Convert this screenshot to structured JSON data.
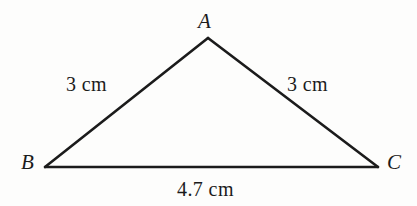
{
  "figure": {
    "type": "triangle-diagram",
    "background_color": "#fdfdfc",
    "stroke_color": "#1b1b1b",
    "text_color": "#1b1b1b"
  },
  "vertices": {
    "a": {
      "label": "A",
      "x": 208,
      "y": 38
    },
    "b": {
      "label": "B",
      "x": 45,
      "y": 167
    },
    "c": {
      "label": "C",
      "x": 378,
      "y": 167
    }
  },
  "sides": {
    "ab": {
      "label": "3 cm",
      "value": 3,
      "unit": "cm"
    },
    "ac": {
      "label": "3 cm",
      "value": 3,
      "unit": "cm"
    },
    "bc": {
      "label": "4.7 cm",
      "value": 4.7,
      "unit": "cm"
    }
  }
}
